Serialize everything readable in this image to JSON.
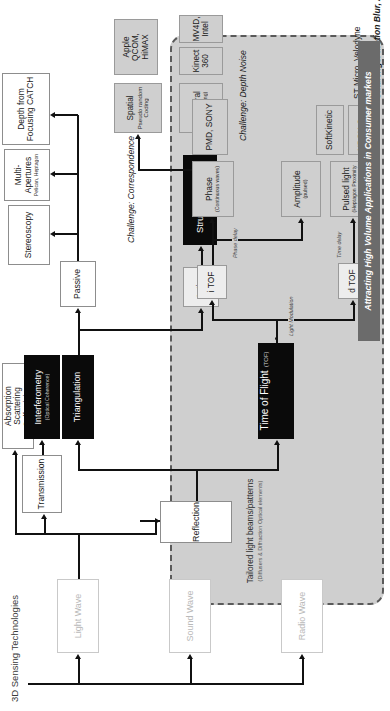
{
  "figure": {
    "root_label": "3D Sensing Technologies",
    "tailored": {
      "title": "Tailored light beams/patterns",
      "subtitle": "(Diffusers & Diffraction Optical elements)"
    },
    "shaded_region_note": "Light Modulation"
  },
  "nodes": {
    "radio_wave": {
      "label": "Radio Wave"
    },
    "sound_wave": {
      "label": "Sound Wave"
    },
    "light_wave": {
      "label": "Light Wave"
    },
    "reflection": {
      "label": "Reflection"
    },
    "transmission": {
      "label": "Transmission"
    },
    "absorption": {
      "label": "Absorption\nScattering\nSelf-mixing",
      "line1": "Absorption",
      "line2": "Scattering",
      "line3": "Self-mixing"
    },
    "interferometry": {
      "label": "Interferometry",
      "subtitle": "(Optical Coherence)"
    },
    "triangulation": {
      "label": "Triangulation"
    },
    "time_of_flight": {
      "label": "Time of Flight",
      "suffix": "(TOF)"
    },
    "passive": {
      "label": "Passive"
    },
    "active": {
      "label": "Active"
    },
    "stereoscopy": {
      "label": "Stereoscopy"
    },
    "multi_apertures": {
      "label": "Multi-Apertures",
      "subtitle": "Pelican, Heptagon"
    },
    "depth_from_focusing": {
      "label": "Depth from\nFocusing CATCH",
      "line1": "Depth from",
      "line2": "Focusing CATCH"
    },
    "structured_light": {
      "label": "Structured Light"
    },
    "spatial": {
      "label": "Spatial",
      "subtitle": "Pseudo random Coding"
    },
    "temporal": {
      "label": "Temporal",
      "subtitle": "(Time Coding)"
    },
    "itof": {
      "label": "i TOF"
    },
    "dtof": {
      "label": "d TOF"
    },
    "phase": {
      "label": "Phase",
      "subtitle": "(Continuous waves)"
    },
    "amplitude": {
      "label": "Amplitude",
      "subtitle": "(pulsed)"
    },
    "pulsed_light": {
      "label": "Pulsed light",
      "subtitle": "(Heptagon Proximity Sensor)"
    }
  },
  "vendors": {
    "apple": {
      "line1": "Apple",
      "line2": "QCOM, HiMAX"
    },
    "kinect360": {
      "label": "Kinect 360"
    },
    "mv4d": {
      "label": "MV4D, Intel"
    },
    "pmd_sony": {
      "label": "PMD, SONY"
    },
    "xbox_one": {
      "label": "XBOX One"
    },
    "softkinetic": {
      "label": "SoftKinetic"
    },
    "st_micro": {
      "label": "ST Micro, Velodyne"
    }
  },
  "connector_labels": {
    "light_modulation": "Light Modulation",
    "phase_delay": "Phase delay",
    "time_delay": "Time delay"
  },
  "challenges": {
    "correspondence": "Challenge: Correspondence",
    "depth_noise": "Challenge: Depth Noise",
    "motion_blur": "Challenge: Motion Blur, Aliasing"
  },
  "banner": {
    "text": "Attracting High Volume Applications in Consumer markets"
  },
  "colors": {
    "black_box": "#0a0a0a",
    "shaded_region": "#cfcfcf",
    "banner": "#6b6b6b",
    "pale_text": "#b9b9b9",
    "line": "#111111"
  }
}
